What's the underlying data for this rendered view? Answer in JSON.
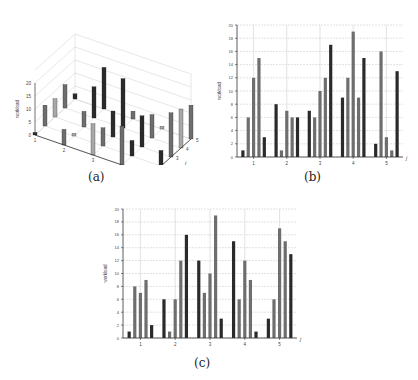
{
  "captions": {
    "a": "(a)",
    "b": "(b)",
    "c": "(c)"
  },
  "colors": {
    "dark": "#2a2a2a",
    "mid": "#6e6e6e",
    "light": "#a8a8a8",
    "grid": "#cfcfcf",
    "axis": "#333333"
  },
  "chart_data": [
    {
      "id": "a",
      "type": "bar3d",
      "title": "",
      "zlabel": "workload",
      "xlabel": "i",
      "ylabel": "j",
      "x_ticks": [
        "1",
        "2",
        "3",
        "4",
        "5"
      ],
      "y_ticks": [
        "1",
        "2",
        "3",
        "4",
        "5"
      ],
      "z_ticks": [
        "0",
        "5",
        "10",
        "15",
        "20"
      ],
      "zlim": [
        0,
        20
      ]
    },
    {
      "id": "b",
      "type": "bar",
      "title": "",
      "xlabel": "j",
      "ylabel": "workload",
      "categories": [
        "1",
        "2",
        "3",
        "4",
        "5"
      ],
      "ylim": [
        0,
        20
      ],
      "y_ticks": [
        "0",
        "2",
        "4",
        "6",
        "8",
        "10",
        "12",
        "14",
        "16",
        "18",
        "20"
      ],
      "grid": true,
      "series": [
        {
          "name": "i=1",
          "values": [
            1,
            8,
            7,
            9,
            2
          ]
        },
        {
          "name": "i=2",
          "values": [
            6,
            1,
            6,
            12,
            16
          ]
        },
        {
          "name": "i=3",
          "values": [
            12,
            7,
            10,
            19,
            3
          ]
        },
        {
          "name": "i=4",
          "values": [
            15,
            6,
            12,
            9,
            1
          ]
        },
        {
          "name": "i=5",
          "values": [
            3,
            6,
            17,
            15,
            13
          ]
        }
      ],
      "groups": [
        [
          1,
          6,
          12,
          15,
          3
        ],
        [
          8,
          1,
          7,
          6,
          6
        ],
        [
          7,
          6,
          10,
          12,
          17
        ],
        [
          9,
          12,
          19,
          9,
          15
        ],
        [
          2,
          16,
          3,
          1,
          13
        ]
      ]
    },
    {
      "id": "c",
      "type": "bar",
      "title": "",
      "xlabel": "j",
      "ylabel": "workload",
      "categories": [
        "1",
        "2",
        "3",
        "4",
        "5"
      ],
      "ylim": [
        0,
        20
      ],
      "y_ticks": [
        "0",
        "2",
        "4",
        "6",
        "8",
        "10",
        "12",
        "14",
        "16",
        "18",
        "20"
      ],
      "grid": true,
      "groups": [
        [
          1,
          8,
          7,
          9,
          2
        ],
        [
          6,
          1,
          6,
          12,
          16
        ],
        [
          12,
          7,
          10,
          19,
          3
        ],
        [
          15,
          6,
          12,
          9,
          1
        ],
        [
          3,
          6,
          17,
          15,
          13
        ]
      ]
    }
  ]
}
